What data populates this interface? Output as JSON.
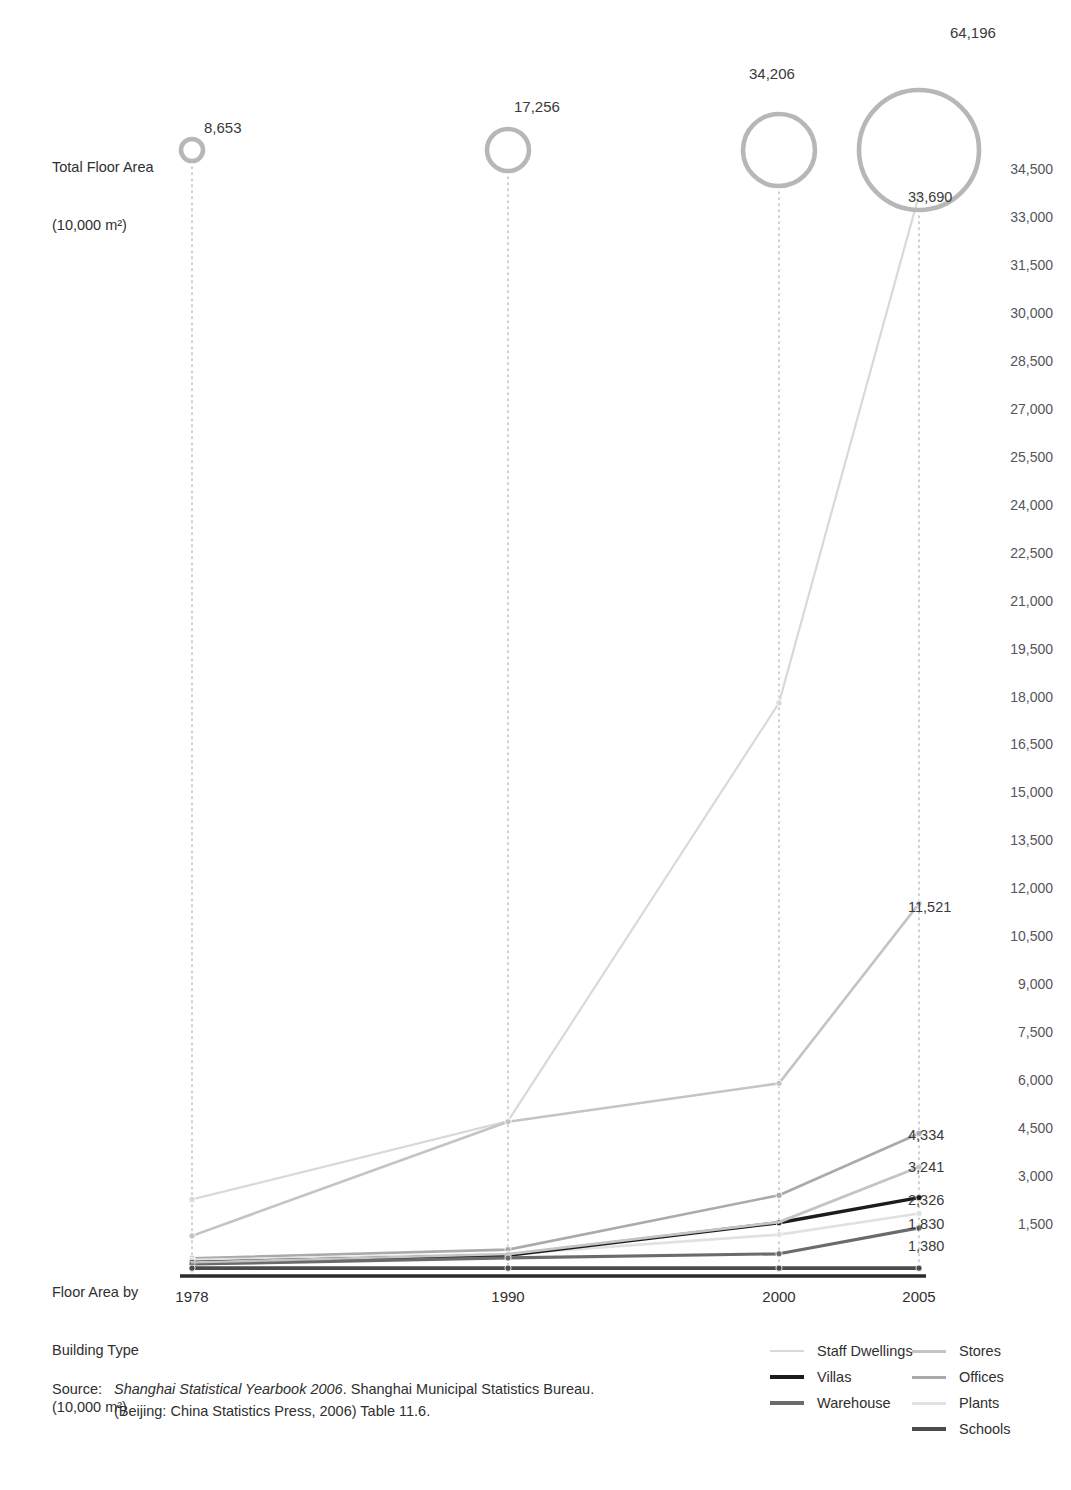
{
  "labels": {
    "total_floor_area_line1": "Total Floor Area",
    "total_floor_area_line2": "(10,000 m²)",
    "floor_area_type_line1": "Floor Area by",
    "floor_area_type_line2": "Building Type",
    "floor_area_type_line3": "(10,000 m²)"
  },
  "source": {
    "key": "Source:",
    "italic_title": "Shanghai Statistical Yearbook 2006",
    "rest_line1": ". Shanghai Municipal Statistics Bureau.",
    "line2": "(Beijing: China Statistics Press, 2006) Table 11.6."
  },
  "colors": {
    "staff_dwellings": "#d8d9d9",
    "villas": "#1c1c1c",
    "warehouse": "#6a6b6d",
    "stores": "#c3c4c5",
    "offices": "#a9aaac",
    "plants": "#e0e1e1",
    "schools": "#4a4b4d",
    "bubble_stroke": "#b6b7b8",
    "dotted_guide": "#b9babb",
    "baseline": "#2b2b2b",
    "text": "#2f2f2f",
    "axis_text": "#55565a"
  },
  "legend": {
    "position": "bottom-right",
    "column_left": [
      {
        "label": "Staff Dwellings",
        "color": "#d8d9d9",
        "width": 2
      },
      {
        "label": "Villas",
        "color": "#1c1c1c",
        "width": 4
      },
      {
        "label": "Warehouse",
        "color": "#6a6b6d",
        "width": 4
      }
    ],
    "column_right": [
      {
        "label": "Stores",
        "color": "#c3c4c5",
        "width": 3
      },
      {
        "label": "Offices",
        "color": "#a9aaac",
        "width": 3
      },
      {
        "label": "Plants",
        "color": "#e0e1e1",
        "width": 3
      },
      {
        "label": "Schools",
        "color": "#4a4b4d",
        "width": 4
      }
    ]
  },
  "chart_data": {
    "type": "line",
    "title": "",
    "xlabel": "",
    "ylabel": "Floor Area by Building Type (10,000 m²)",
    "categories": [
      "1978",
      "1990",
      "2000",
      "2005"
    ],
    "ylim": [
      0,
      34500
    ],
    "ytick_step": 1500,
    "yticks": [
      34500,
      33000,
      31500,
      30000,
      28500,
      27000,
      25500,
      24000,
      22500,
      21000,
      19500,
      18000,
      16500,
      15000,
      13500,
      12000,
      10500,
      9000,
      7500,
      6000,
      4500,
      3000,
      1500
    ],
    "grid": false,
    "legend_position": "bottom-right",
    "series": [
      {
        "name": "Staff Dwellings",
        "color": "#d8d9d9",
        "width": 2.2,
        "values": [
          2270,
          4720,
          17800,
          33690
        ],
        "end_label": "33,690"
      },
      {
        "name": "Stores",
        "color": "#c3c4c5",
        "width": 2.6,
        "values": [
          1130,
          4700,
          5900,
          11521
        ],
        "end_label": "11,521"
      },
      {
        "name": "Offices",
        "color": "#a9aaac",
        "width": 2.6,
        "values": [
          430,
          700,
          2400,
          4334
        ],
        "end_label": "4,334"
      },
      {
        "name": "Plants",
        "color": "#e0e1e1",
        "width": 2.6,
        "values": [
          380,
          560,
          1170,
          1830
        ],
        "end_label": "1,830"
      },
      {
        "name": "Villas",
        "color": "#1c1c1c",
        "width": 3.4,
        "values": [
          300,
          520,
          1540,
          2326
        ],
        "end_label": "2,326"
      },
      {
        "name": "Warehouse",
        "color": "#6a6b6d",
        "width": 3.2,
        "values": [
          250,
          440,
          570,
          1380
        ],
        "end_label": "1,380"
      },
      {
        "name": "Schools",
        "color": "#4a4b4d",
        "width": 3.6,
        "values": [
          120,
          120,
          120,
          120
        ],
        "end_label": ""
      }
    ],
    "bubbles": {
      "name": "Total Floor Area",
      "unit": "(10,000 m²)",
      "stroke": "#b6b7b8",
      "points": [
        {
          "category": "1978",
          "value": 8653,
          "label": "8,653",
          "radius": 11
        },
        {
          "category": "1990",
          "value": 17256,
          "label": "17,256",
          "radius": 21
        },
        {
          "category": "2000",
          "value": 34206,
          "label": "34,206",
          "radius": 36
        },
        {
          "category": "2005",
          "value": 64196,
          "label": "64,196",
          "radius": 60
        }
      ]
    },
    "end_labels": [
      "33,690",
      "11,521",
      "4,334",
      "3,241",
      "2,326",
      "1,830",
      "1,380"
    ]
  }
}
